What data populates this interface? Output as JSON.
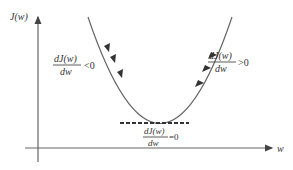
{
  "diagram": {
    "y_axis_label": "J(w)",
    "x_axis_label": "w",
    "left_label": {
      "numerator": "dJ(w)",
      "denominator": "dw",
      "relation": "<0"
    },
    "right_label": {
      "numerator": "dJ(w)",
      "denominator": "dw",
      "relation": ">0"
    },
    "min_label": {
      "numerator": "dJ(w)",
      "denominator": "dw",
      "relation": "=0"
    },
    "colors": {
      "axis": "#555555",
      "curve": "#555555",
      "arrow": "#333333",
      "dashed": "#333333",
      "text": "#333333"
    }
  }
}
